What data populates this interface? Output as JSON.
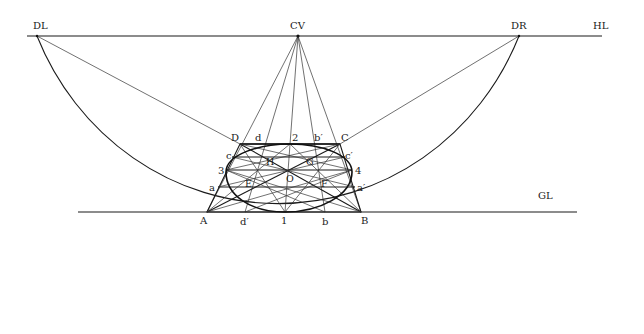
{
  "diagram": {
    "type": "perspective-circle-construction",
    "lines": {
      "horizon": "HL",
      "ground": "GL"
    },
    "points": {
      "distance_left": "DL",
      "center_of_vision": "CV",
      "distance_right": "DR",
      "square_corners": [
        "A",
        "B",
        "C",
        "D"
      ],
      "midpoints": [
        "1",
        "2",
        "3",
        "4"
      ],
      "center": "O",
      "diagonal_points": [
        "E",
        "F",
        "G",
        "H"
      ],
      "side_divisions_left": [
        "a",
        "c"
      ],
      "side_divisions_right": [
        "a′",
        "c′"
      ],
      "top_divisions": [
        "d",
        "b′"
      ],
      "base_divisions": [
        "d′",
        "b"
      ]
    },
    "labels": {
      "DL": "DL",
      "CV": "CV",
      "DR": "DR",
      "HL": "HL",
      "GL": "GL",
      "A": "A",
      "B": "B",
      "C": "C",
      "D": "D",
      "p1": "1",
      "p2": "2",
      "p3": "3",
      "p4": "4",
      "O": "O",
      "E_left": "E",
      "F_right": "F",
      "G": "G",
      "H": "H",
      "a": "a",
      "a_prime": "a′",
      "c": "c",
      "c_prime": "c′",
      "d": "d",
      "d_prime": "d′",
      "b": "b",
      "b_prime": "b′"
    }
  }
}
